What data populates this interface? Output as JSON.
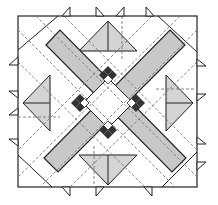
{
  "diagram": {
    "title": "Quilt block diagram",
    "colors": {
      "background": "#ffffff",
      "outline": "#222222",
      "band_fill": "#c8c8c8",
      "triangle_fill": "#d4d4d4",
      "diamond_dark": "#333333",
      "diamond_light": "#ffffff",
      "seam_dashed": "#777777"
    },
    "block": {
      "x": 18,
      "y": 16,
      "size": 179
    },
    "diamond_clusters": [
      {
        "cx": 108,
        "cy": 75
      },
      {
        "cx": 80,
        "cy": 103
      },
      {
        "cx": 136,
        "cy": 103
      },
      {
        "cx": 108,
        "cy": 130
      }
    ]
  }
}
